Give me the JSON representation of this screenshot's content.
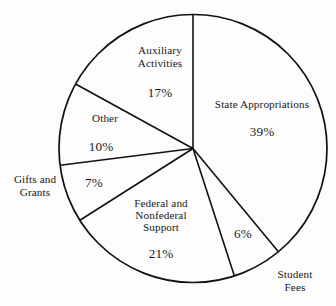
{
  "chart_data": {
    "type": "pie",
    "title": "",
    "subtitle": "",
    "xlabel": "",
    "ylabel": "",
    "legend_position": "none",
    "grid": false,
    "value_unit": "%",
    "start_angle_deg": 0,
    "direction": "clockwise",
    "categories": [
      "State Appropriations",
      "Student Fees",
      "Federal and Nonfederal Support",
      "Gifts and Grants",
      "Other",
      "Auxiliary Activities"
    ],
    "values": [
      39,
      6,
      21,
      7,
      10,
      17
    ],
    "slices": [
      {
        "label": "State Appropriations",
        "label_lines": [
          "State Appropriations"
        ],
        "value": 39,
        "value_label": "39%",
        "label_placement": "inside",
        "angle_deg": 140.4
      },
      {
        "label": "Student Fees",
        "label_lines": [
          "Student",
          "Fees"
        ],
        "value": 6,
        "value_label": "6%",
        "label_placement": "outside",
        "angle_deg": 21.6
      },
      {
        "label": "Federal and Nonfederal Support",
        "label_lines": [
          "Federal and",
          "Nonfederal",
          "Support"
        ],
        "value": 21,
        "value_label": "21%",
        "label_placement": "inside",
        "angle_deg": 75.6
      },
      {
        "label": "Gifts and Grants",
        "label_lines": [
          "Gifts and",
          "Grants"
        ],
        "value": 7,
        "value_label": "7%",
        "label_placement": "outside",
        "angle_deg": 25.2
      },
      {
        "label": "Other",
        "label_lines": [
          "Other"
        ],
        "value": 10,
        "value_label": "10%",
        "label_placement": "inside",
        "angle_deg": 36
      },
      {
        "label": "Auxiliary Activities",
        "label_lines": [
          "Auxiliary",
          "Activities"
        ],
        "value": 17,
        "value_label": "17%",
        "label_placement": "inside",
        "angle_deg": 61.2
      }
    ],
    "colors": {
      "slice_fill": "#ffffff",
      "outline": "#111111",
      "text": "#191919",
      "background": "#fdfdfd"
    }
  },
  "labels": {
    "state_appropriations": {
      "name": "State Appropriations",
      "pct": "39%"
    },
    "student_fees": {
      "line1": "Student",
      "line2": "Fees",
      "pct": "6%"
    },
    "federal_support": {
      "line1": "Federal and",
      "line2": "Nonfederal",
      "line3": "Support",
      "pct": "21%"
    },
    "gifts_grants": {
      "line1": "Gifts and",
      "line2": "Grants",
      "pct": "7%"
    },
    "other": {
      "name": "Other",
      "pct": "10%"
    },
    "auxiliary_activities": {
      "line1": "Auxiliary",
      "line2": "Activities",
      "pct": "17%"
    }
  }
}
